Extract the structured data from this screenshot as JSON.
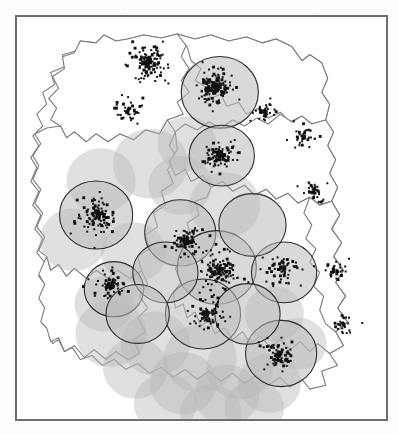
{
  "figure": {
    "kind": "scanned-map-figure",
    "domain": "map",
    "caption_visible": false,
    "title": "",
    "background_color": "#ffffff",
    "page_tone": "#fdfdfc"
  },
  "frame": {
    "name": "map-border-frame",
    "x": 15,
    "y": 15,
    "width": 373,
    "height": 406,
    "border_color": "#6e6e70",
    "border_width_px": 2,
    "fill": "#ffffff"
  },
  "map": {
    "outline_color": "#7a7a7c",
    "outline_width_px": 1.1,
    "fill": "#ffffff",
    "region_count": 8,
    "boundary_style": "solid-thin-gray"
  },
  "circles": {
    "name": "buffer-circles",
    "stroke_color": "#2b2b2b",
    "stroke_width_px": 1.1,
    "fill_color": "#b9b9b9",
    "fill_opacity": 0.55,
    "unstroked_fill_opacity": 0.42,
    "total_count": 34,
    "outlined_count": 13,
    "radius_range_px": [
      30,
      42
    ]
  },
  "points": {
    "name": "observation-points",
    "color": "#111111",
    "marker_size_px": 2,
    "approx_count": 1400,
    "distribution": "clustered"
  },
  "legend": {
    "present": false,
    "items": []
  },
  "axes": {
    "present": false,
    "labels": []
  },
  "chart_data": {
    "type": "map",
    "title": "",
    "xlabel": "",
    "ylabel": "",
    "grid": false,
    "legend_position": "none",
    "xlim": [
      0,
      373
    ],
    "ylim": [
      0,
      406
    ],
    "layers": [
      {
        "name": "region-outlines",
        "type": "polygon",
        "stroke": "#7a7a7c",
        "fill": "#ffffff",
        "count": 8
      },
      {
        "name": "buffer-circles-outlined",
        "type": "circle",
        "stroke": "#2b2b2b",
        "fill": "#b9b9b9",
        "opacity": 0.55,
        "items": [
          {
            "cx": 205,
            "cy": 76,
            "r": 39
          },
          {
            "cx": 207,
            "cy": 140,
            "r": 33
          },
          {
            "cx": 80,
            "cy": 200,
            "r": 37
          },
          {
            "cx": 165,
            "cy": 218,
            "r": 36
          },
          {
            "cx": 202,
            "cy": 253,
            "r": 40
          },
          {
            "cx": 98,
            "cy": 275,
            "r": 30
          },
          {
            "cx": 188,
            "cy": 300,
            "r": 38
          },
          {
            "cx": 270,
            "cy": 258,
            "r": 33
          },
          {
            "cx": 267,
            "cy": 340,
            "r": 36
          },
          {
            "cx": 150,
            "cy": 258,
            "r": 33
          },
          {
            "cx": 238,
            "cy": 210,
            "r": 34
          },
          {
            "cx": 122,
            "cy": 300,
            "r": 32
          },
          {
            "cx": 233,
            "cy": 300,
            "r": 33
          }
        ]
      },
      {
        "name": "buffer-circles-plain",
        "type": "circle",
        "stroke": "none",
        "fill": "#b5b5b5",
        "opacity": 0.42,
        "items": [
          {
            "cx": 135,
            "cy": 148,
            "r": 38
          },
          {
            "cx": 85,
            "cy": 165,
            "r": 35
          },
          {
            "cx": 210,
            "cy": 190,
            "r": 36
          },
          {
            "cx": 57,
            "cy": 225,
            "r": 34
          },
          {
            "cx": 118,
            "cy": 238,
            "r": 33
          },
          {
            "cx": 165,
            "cy": 170,
            "r": 32
          },
          {
            "cx": 95,
            "cy": 320,
            "r": 36
          },
          {
            "cx": 140,
            "cy": 330,
            "r": 35
          },
          {
            "cx": 185,
            "cy": 345,
            "r": 37
          },
          {
            "cx": 225,
            "cy": 355,
            "r": 34
          },
          {
            "cx": 120,
            "cy": 355,
            "r": 33
          },
          {
            "cx": 168,
            "cy": 370,
            "r": 34
          },
          {
            "cx": 212,
            "cy": 382,
            "r": 33
          },
          {
            "cx": 255,
            "cy": 370,
            "r": 32
          },
          {
            "cx": 150,
            "cy": 390,
            "r": 32
          },
          {
            "cx": 196,
            "cy": 400,
            "r": 31
          },
          {
            "cx": 240,
            "cy": 395,
            "r": 30
          },
          {
            "cx": 88,
            "cy": 290,
            "r": 30
          },
          {
            "cx": 260,
            "cy": 300,
            "r": 30
          },
          {
            "cx": 285,
            "cy": 330,
            "r": 28
          },
          {
            "cx": 172,
            "cy": 128,
            "r": 30
          }
        ]
      },
      {
        "name": "point-clusters",
        "type": "scatter",
        "marker": "square",
        "color": "#111111",
        "clusters": [
          {
            "cx": 132,
            "cy": 45,
            "spread": 26,
            "n": 150
          },
          {
            "cx": 200,
            "cy": 70,
            "spread": 24,
            "n": 190
          },
          {
            "cx": 205,
            "cy": 140,
            "spread": 20,
            "n": 120
          },
          {
            "cx": 82,
            "cy": 200,
            "spread": 28,
            "n": 130
          },
          {
            "cx": 170,
            "cy": 225,
            "spread": 22,
            "n": 100
          },
          {
            "cx": 205,
            "cy": 255,
            "spread": 28,
            "n": 150
          },
          {
            "cx": 95,
            "cy": 272,
            "spread": 20,
            "n": 90
          },
          {
            "cx": 192,
            "cy": 300,
            "spread": 24,
            "n": 80
          },
          {
            "cx": 268,
            "cy": 255,
            "spread": 26,
            "n": 70
          },
          {
            "cx": 265,
            "cy": 342,
            "spread": 24,
            "n": 90
          },
          {
            "cx": 290,
            "cy": 120,
            "spread": 18,
            "n": 45
          },
          {
            "cx": 300,
            "cy": 175,
            "spread": 16,
            "n": 40
          },
          {
            "cx": 250,
            "cy": 95,
            "spread": 18,
            "n": 50
          },
          {
            "cx": 112,
            "cy": 95,
            "spread": 22,
            "n": 45
          },
          {
            "cx": 320,
            "cy": 255,
            "spread": 20,
            "n": 35
          },
          {
            "cx": 330,
            "cy": 310,
            "spread": 18,
            "n": 30
          }
        ]
      }
    ]
  }
}
